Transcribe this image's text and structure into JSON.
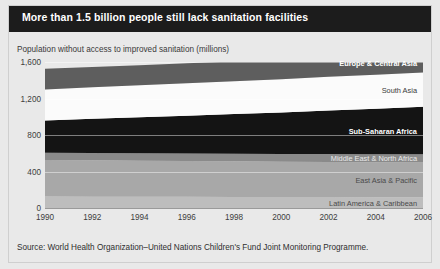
{
  "header": {
    "title": "More than 1.5 billion people still lack sanitation facilities",
    "title_bg": "#1c1c1c",
    "title_color": "#ffffff"
  },
  "source": {
    "text": "Source: World Health Organization–United Nations Children's Fund Joint Monitoring Programme."
  },
  "chart_data": {
    "type": "area",
    "title": "More than 1.5 billion people still lack sanitation facilities",
    "subtitle": "Population without access to improved sanitation (millions)",
    "xlabel": "",
    "ylabel": "Population without access to improved sanitation (millions)",
    "stacked": true,
    "grid": true,
    "legend_position": "inline-right",
    "x": [
      1990,
      1992,
      1994,
      1996,
      1998,
      2000,
      2002,
      2004,
      2006
    ],
    "tick_labels_x": [
      "1990",
      "1992",
      "1994",
      "1996",
      "1998",
      "2000",
      "2002",
      "2004",
      "2006"
    ],
    "ylim": [
      0,
      1600
    ],
    "yticks": [
      0,
      400,
      800,
      1200,
      1600
    ],
    "tick_labels_y": [
      "0",
      "400",
      "800",
      "1,200",
      "1,600"
    ],
    "series": [
      {
        "name": "Latin America & Caribbean",
        "color": "#bdbdbd",
        "label_color": "#4a4a4a",
        "label_bold": false,
        "values": [
          125,
          124,
          123,
          122,
          121,
          120,
          120,
          119,
          119
        ]
      },
      {
        "name": "East Asia & Pacific",
        "color": "#a8a8a8",
        "label_color": "#4a4a4a",
        "label_bold": false,
        "values": [
          400,
          398,
          395,
          392,
          390,
          387,
          385,
          383,
          381
        ]
      },
      {
        "name": "Middle East & North Africa",
        "color": "#8a8a8a",
        "label_color": "#eaeaea",
        "label_bold": false,
        "values": [
          80,
          81,
          82,
          83,
          84,
          85,
          86,
          87,
          88
        ]
      },
      {
        "name": "Sub-Saharan Africa",
        "color": "#141414",
        "label_color": "#ffffff",
        "label_bold": true,
        "values": [
          355,
          375,
          395,
          415,
          435,
          455,
          478,
          500,
          522
        ]
      },
      {
        "name": "South Asia",
        "color": "#fbfbfb",
        "label_color": "#3a3a3a",
        "label_bold": false,
        "values": [
          340,
          345,
          350,
          355,
          360,
          364,
          368,
          372,
          376
        ]
      },
      {
        "name": "Europe & Central Asia",
        "color": "#5e5e5e",
        "label_color": "#ffffff",
        "label_bold": true,
        "values": [
          225,
          222,
          220,
          218,
          216,
          214,
          212,
          210,
          208
        ]
      }
    ],
    "totals": [
      1525,
      1545,
      1565,
      1585,
      1606,
      1625,
      1649,
      1671,
      1694
    ]
  }
}
